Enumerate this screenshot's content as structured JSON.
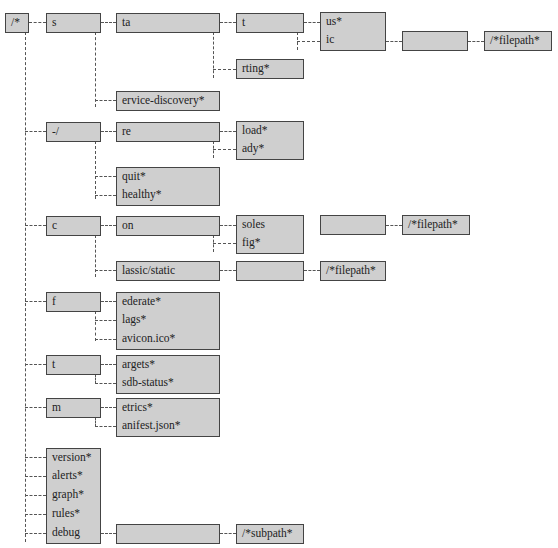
{
  "diagram": {
    "title": "",
    "root": "/*",
    "nodes": {
      "root": "/*",
      "s": "s",
      "ta": "ta",
      "t": "t",
      "us": "us*",
      "ic": "ic",
      "ic_blank": "",
      "ic_filepath": "/*filepath*",
      "rting": "rting*",
      "service_discovery": "ervice-discovery*",
      "dash": "-/",
      "re": "re",
      "load": "load*",
      "ady": "ady*",
      "quit": "quit*",
      "healthy": "healthy*",
      "c": "c",
      "on": "on",
      "soles": "soles",
      "fig": "fig*",
      "soles_blank": "",
      "soles_filepath": "/*filepath*",
      "lassic_static": "lassic/static",
      "static_blank": "",
      "static_filepath": "/*filepath*",
      "f": "f",
      "ederate": "ederate*",
      "lags": "lags*",
      "avicon": "avicon.ico*",
      "t2": "t",
      "argets": "argets*",
      "sdb_status": "sdb-status*",
      "m": "m",
      "etrics": "etrics*",
      "anifest": "anifest.json*",
      "version": "version*",
      "alerts": "alerts*",
      "graph": "graph*",
      "rules": "rules*",
      "debug": "debug",
      "debug_blank": "",
      "subpath": "/*subpath*"
    },
    "colors": {
      "node_fill": "#cfcfcf",
      "node_border": "#444444",
      "edge": "#555555",
      "background": "#ffffff"
    }
  }
}
